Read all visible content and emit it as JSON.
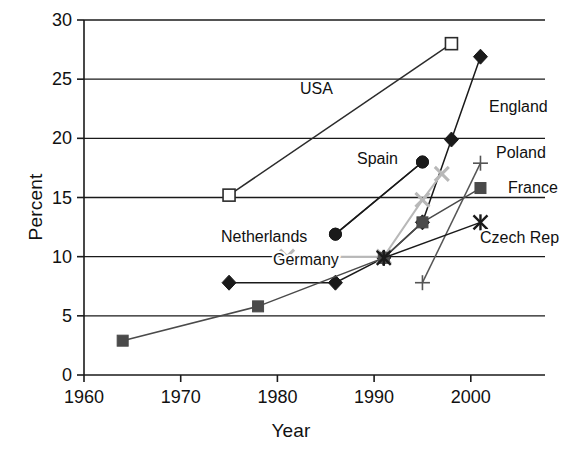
{
  "chart_data": {
    "type": "line",
    "title": "",
    "xlabel": "Year",
    "ylabel": "Percent",
    "xlim": [
      1960,
      2006
    ],
    "ylim": [
      0,
      30
    ],
    "xticks": [
      1960,
      1970,
      1980,
      1990,
      2000
    ],
    "yticks": [
      0,
      5,
      10,
      15,
      20,
      25,
      30
    ],
    "grid": "horizontal",
    "legend_position": "inline-annotations",
    "series": [
      {
        "name": "USA",
        "marker": "open-square",
        "color": "#2b2b2b",
        "label_x": 1960,
        "points": [
          {
            "x": 1975,
            "y": 15.2
          },
          {
            "x": 1998,
            "y": 28.0
          }
        ]
      },
      {
        "name": "England",
        "marker": "filled-diamond",
        "color": "#1a1a1a",
        "points": [
          {
            "x": 1975,
            "y": 7.8
          },
          {
            "x": 1986,
            "y": 7.8
          },
          {
            "x": 1991,
            "y": 9.9
          },
          {
            "x": 1995,
            "y": 12.9
          },
          {
            "x": 1998,
            "y": 19.9
          },
          {
            "x": 2001,
            "y": 26.9
          }
        ]
      },
      {
        "name": "Spain",
        "marker": "filled-circle",
        "color": "#1a1a1a",
        "points": [
          {
            "x": 1986,
            "y": 11.9
          },
          {
            "x": 1995,
            "y": 18.0
          }
        ]
      },
      {
        "name": "Netherlands",
        "marker": "filled-circle",
        "color": "#1a1a1a",
        "points": [
          {
            "x": 1986,
            "y": 11.9
          },
          {
            "x": 1995,
            "y": 18.0
          }
        ]
      },
      {
        "name": "Germany",
        "marker": "light-cross",
        "color": "#b8b8b8",
        "points": [
          {
            "x": 1981,
            "y": 10.0
          },
          {
            "x": 1991,
            "y": 10.0
          },
          {
            "x": 1995,
            "y": 14.8
          },
          {
            "x": 1997,
            "y": 17.0
          }
        ]
      },
      {
        "name": "Poland",
        "marker": "thin-plus",
        "color": "#555555",
        "points": [
          {
            "x": 1995,
            "y": 7.8
          },
          {
            "x": 2001,
            "y": 17.9
          }
        ]
      },
      {
        "name": "France",
        "marker": "filled-square",
        "color": "#4a4a4a",
        "points": [
          {
            "x": 1964,
            "y": 2.9
          },
          {
            "x": 1978,
            "y": 5.8
          },
          {
            "x": 1991,
            "y": 9.9
          },
          {
            "x": 1995,
            "y": 12.9
          },
          {
            "x": 2001,
            "y": 15.8
          }
        ]
      },
      {
        "name": "Czech Rep",
        "marker": "star-x",
        "color": "#1a1a1a",
        "points": [
          {
            "x": 1991,
            "y": 9.9
          },
          {
            "x": 2001,
            "y": 12.9
          }
        ]
      }
    ],
    "annotations": [
      {
        "text": "USA",
        "x_px": 300,
        "y_px": 94
      },
      {
        "text": "England",
        "x_px": 489,
        "y_px": 112
      },
      {
        "text": "Spain",
        "x_px": 357,
        "y_px": 164
      },
      {
        "text": "Poland",
        "x_px": 496,
        "y_px": 158
      },
      {
        "text": "France",
        "x_px": 508,
        "y_px": 193
      },
      {
        "text": "Netherlands",
        "x_px": 221,
        "y_px": 242
      },
      {
        "text": "Germany",
        "x_px": 273,
        "y_px": 265
      },
      {
        "text": "Czech Rep",
        "x_px": 480,
        "y_px": 243
      }
    ]
  },
  "axis": {
    "y_title": "Percent",
    "x_title": "Year",
    "x_tick_labels": [
      "1960",
      "1970",
      "1980",
      "1990",
      "2000"
    ],
    "y_tick_labels": [
      "0",
      "5",
      "10",
      "15",
      "20",
      "25",
      "30"
    ]
  },
  "colors": {
    "axis": "#1a1a1a",
    "grid": "#1a1a1a",
    "background": "#ffffff",
    "germany_light": "#b8b8b8",
    "france_gray": "#4a4a4a",
    "poland_gray": "#555555"
  }
}
